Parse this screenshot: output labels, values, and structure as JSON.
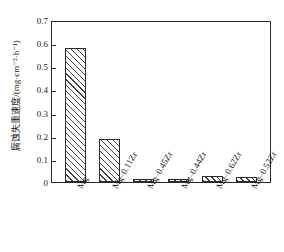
{
  "chart_data": {
    "type": "bar",
    "title": "",
    "subtitle": "",
    "xlabel": "",
    "ylabel": "腐蚀失重速度/(mg·cm⁻²·h⁻¹)",
    "categories": [
      "Mg",
      "Mg–0.11Zr",
      "Mg–0.45Zr",
      "Mg–0.44Zr",
      "Mg–0.62Zr",
      "Mg–0.52Zr"
    ],
    "values": [
      0.578,
      0.186,
      0.013,
      0.009,
      0.026,
      0.022
    ],
    "ylim": [
      0,
      0.7
    ],
    "ytick_labels": [
      "0",
      "0.1",
      "0.2",
      "0.3",
      "0.4",
      "0.5",
      "0.6",
      "0.7"
    ],
    "ytick_values": [
      0,
      0.1,
      0.2,
      0.3,
      0.4,
      0.5,
      0.6,
      0.7
    ],
    "grid": false,
    "legend": null,
    "legend_position": "none",
    "bar_fill": "diagonal-hatch",
    "bar_edge_color": "#2b2b2b",
    "background_color": "#ffffff",
    "annotations": []
  },
  "axes": {
    "y_title": "腐蚀失重速度/(mg·cm⁻²·h⁻¹)"
  }
}
